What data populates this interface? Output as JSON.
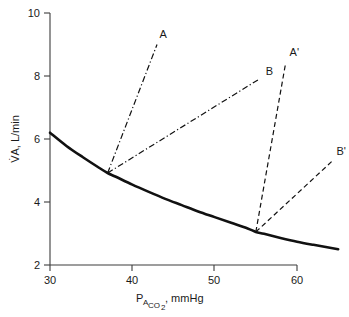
{
  "chart_data": {
    "type": "line",
    "title": "",
    "xlabel": "PACO2, mmHg",
    "xlabel_parts": {
      "p": "P",
      "sub_a": "A",
      "sub_co2": "CO",
      "sub_co2_num": "2",
      "units": ", mmHg"
    },
    "ylabel": "V̇A, L/min",
    "xlim": [
      28,
      66
    ],
    "ylim": [
      2,
      10
    ],
    "xticks": [
      30,
      40,
      50,
      60
    ],
    "yticks": [
      2,
      4,
      6,
      8,
      10
    ],
    "grid": false,
    "legend_position": "inline-end-labels",
    "series": [
      {
        "name": "metabolic-hyperbola",
        "label": "",
        "style": "solid",
        "points": [
          [
            30.0,
            6.2
          ],
          [
            32.0,
            5.78
          ],
          [
            34.0,
            5.42
          ],
          [
            36.0,
            5.08
          ],
          [
            37.0,
            4.92
          ],
          [
            38.0,
            4.8
          ],
          [
            40.0,
            4.55
          ],
          [
            42.0,
            4.32
          ],
          [
            44.0,
            4.1
          ],
          [
            46.0,
            3.9
          ],
          [
            48.0,
            3.7
          ],
          [
            50.0,
            3.52
          ],
          [
            52.0,
            3.34
          ],
          [
            54.0,
            3.16
          ],
          [
            55.0,
            3.05
          ],
          [
            56.0,
            2.99
          ],
          [
            58.0,
            2.86
          ],
          [
            60.0,
            2.74
          ],
          [
            62.0,
            2.64
          ],
          [
            65.0,
            2.5
          ]
        ]
      },
      {
        "name": "ventilatory-response-A",
        "label": "A",
        "style": "dash-dot",
        "points": [
          [
            37.0,
            4.92
          ],
          [
            43.0,
            9.0
          ]
        ],
        "label_point": [
          43.3,
          9.22
        ]
      },
      {
        "name": "ventilatory-response-B",
        "label": "B",
        "style": "dash-dot",
        "points": [
          [
            37.0,
            4.92
          ],
          [
            55.4,
            7.9
          ]
        ],
        "label_point": [
          56.2,
          8.02
        ]
      },
      {
        "name": "ventilatory-response-A-prime",
        "label": "A'",
        "style": "dashed",
        "points": [
          [
            55.0,
            3.05
          ],
          [
            58.6,
            8.38
          ]
        ],
        "label_point": [
          59.1,
          8.62
        ]
      },
      {
        "name": "ventilatory-response-B-prime",
        "label": "B'",
        "style": "dashed",
        "points": [
          [
            55.0,
            3.05
          ],
          [
            64.2,
            5.28
          ]
        ],
        "label_point": [
          64.8,
          5.48
        ]
      }
    ]
  }
}
